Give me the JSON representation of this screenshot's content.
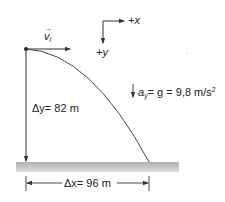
{
  "diagram": {
    "axes": {
      "x_label": "+x",
      "y_label": "+y"
    },
    "initial_velocity": {
      "symbol": "v",
      "subscript": "i",
      "vector_mark": "→"
    },
    "acceleration": {
      "symbol": "a",
      "subscript": "y",
      "equals_g": "= g = 9,8 m/s",
      "exponent": "2"
    },
    "vertical_displacement": {
      "symbol": "Δy",
      "value": "= 82 m"
    },
    "horizontal_displacement": {
      "symbol": "Δx",
      "value": "= 96 m"
    },
    "colors": {
      "line": "#333333",
      "ground_light": "#d8d8d8",
      "ground_dark": "#a8a8a8"
    }
  }
}
